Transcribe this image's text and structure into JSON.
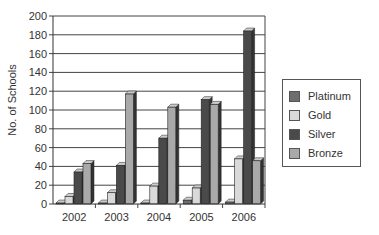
{
  "chart_data": {
    "type": "bar",
    "style": "3d-clustered-column",
    "title": "",
    "xlabel": "",
    "ylabel": "No. of Schools",
    "categories": [
      "2002",
      "2003",
      "2004",
      "2005",
      "2006"
    ],
    "series": [
      {
        "name": "Platinum",
        "color": "#6e6e6e",
        "values": [
          1,
          1,
          1,
          4,
          2
        ]
      },
      {
        "name": "Gold",
        "color": "#d9d9d9",
        "values": [
          8,
          12,
          19,
          17,
          48
        ]
      },
      {
        "name": "Silver",
        "color": "#4a4a4a",
        "values": [
          34,
          41,
          70,
          111,
          184
        ]
      },
      {
        "name": "Bronze",
        "color": "#a9a9a9",
        "values": [
          43,
          117,
          103,
          106,
          46
        ]
      }
    ],
    "ylim": [
      0,
      200
    ],
    "yticks": [
      0,
      20,
      40,
      60,
      80,
      100,
      120,
      140,
      160,
      180,
      200
    ],
    "grid": true,
    "legend_position": "right"
  },
  "legend": {
    "items": [
      {
        "label": "Platinum",
        "color": "#6e6e6e"
      },
      {
        "label": "Gold",
        "color": "#d9d9d9"
      },
      {
        "label": "Silver",
        "color": "#4a4a4a"
      },
      {
        "label": "Bronze",
        "color": "#a9a9a9"
      }
    ]
  }
}
